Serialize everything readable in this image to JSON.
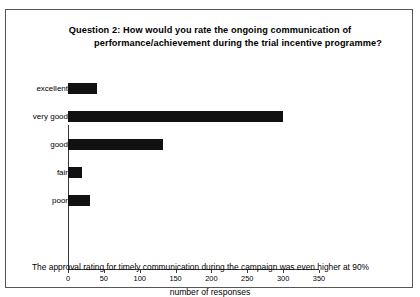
{
  "title": {
    "line1": "Question 2: How would you rate the ongoing communication of",
    "line2": "performance/achievement during the trial incentive programme?"
  },
  "caption": "The approval rating for timely communication during the campaign was even higher at 90%",
  "chart_data": {
    "type": "bar",
    "orientation": "horizontal",
    "title": "Question 2: How would you rate the ongoing communication of performance/achievement during the trial incentive programme?",
    "categories": [
      "excellent",
      "very good",
      "good",
      "fair",
      "poor"
    ],
    "values": [
      40,
      300,
      132,
      20,
      30
    ],
    "xlabel": "number of responses",
    "ylabel": "",
    "xlim": [
      0,
      350
    ],
    "xticks": [
      0,
      50,
      100,
      150,
      200,
      250,
      300,
      350
    ],
    "xtick_labels": [
      "0",
      "50",
      "100",
      "150",
      "200",
      "250",
      "300",
      "350"
    ],
    "grid": false,
    "legend": false,
    "bar_color": "#111111",
    "axis_color": "#3a3a3a",
    "background": "#ffffff"
  }
}
